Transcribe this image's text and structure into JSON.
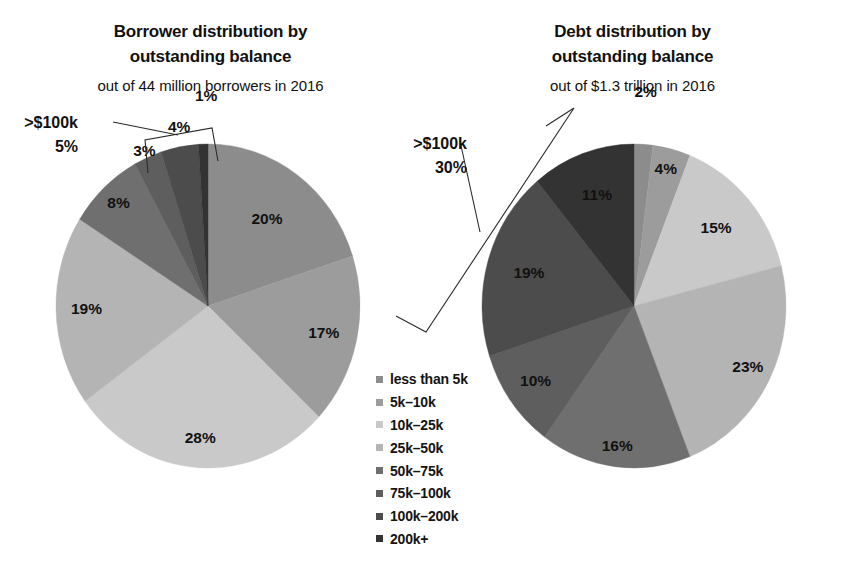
{
  "figure": {
    "background": "#ffffff",
    "text_color": "#111111"
  },
  "left": {
    "title_line1": "Borrower distribution by",
    "title_line2": "outstanding balance",
    "subtitle": "out of  44 million borrowers in 2016",
    "callout_line1": ">$100k",
    "callout_line2": "5%"
  },
  "right": {
    "title_line1": "Debt distribution by",
    "title_line2": "outstanding balance",
    "subtitle": "out of $1.3 trillion in 2016",
    "callout_line1": ">$100k",
    "callout_line2": "30%"
  },
  "legend": {
    "position": "center-bottom",
    "items": [
      {
        "label": "less than 5k",
        "color": "#8c8c8c"
      },
      {
        "label": "5k–10k",
        "color": "#9c9c9c"
      },
      {
        "label": "10k–25k",
        "color": "#c9c9c9"
      },
      {
        "label": "25k–50k",
        "color": "#b4b4b4"
      },
      {
        "label": "50k–75k",
        "color": "#6f6f6f"
      },
      {
        "label": "75k–100k",
        "color": "#5e5e5e"
      },
      {
        "label": "100k–200k",
        "color": "#4c4c4c"
      },
      {
        "label": "200k+",
        "color": "#333333"
      }
    ]
  },
  "chart_data": [
    {
      "type": "pie",
      "title": "Borrower distribution by outstanding balance",
      "subtitle": "out of  44 million borrowers in 2016",
      "categories": [
        "less than 5k",
        "5k–10k",
        "10k–25k",
        "25k–50k",
        "50k–75k",
        "75k–100k",
        "100k–200k",
        "200k+"
      ],
      "values": [
        20,
        17,
        28,
        19,
        8,
        3,
        4,
        1
      ],
      "labels": [
        "20%",
        "17%",
        "28%",
        "19%",
        "8%",
        "3%",
        "4%",
        "1%"
      ],
      "colors": [
        "#8c8c8c",
        "#9c9c9c",
        "#c9c9c9",
        "#b4b4b4",
        "#6f6f6f",
        "#5e5e5e",
        "#4c4c4c",
        "#333333"
      ],
      "unit": "percent",
      "start_angle_deg": 0,
      "direction": "clockwise",
      "annotation": {
        "text": ">$100k 5%",
        "covers": [
          "100k–200k",
          "200k+"
        ],
        "sum": 5
      }
    },
    {
      "type": "pie",
      "title": "Debt distribution by outstanding balance",
      "subtitle": "out of $1.3 trillion in 2016",
      "categories": [
        "less than 5k",
        "5k–10k",
        "10k–25k",
        "25k–50k",
        "50k–75k",
        "75k–100k",
        "100k–200k",
        "200k+"
      ],
      "values": [
        2,
        4,
        15,
        23,
        16,
        10,
        19,
        11
      ],
      "labels": [
        "2%",
        "4%",
        "15%",
        "23%",
        "16%",
        "10%",
        "19%",
        "11%"
      ],
      "colors": [
        "#8c8c8c",
        "#9c9c9c",
        "#c9c9c9",
        "#b4b4b4",
        "#6f6f6f",
        "#5e5e5e",
        "#4c4c4c",
        "#333333"
      ],
      "unit": "percent",
      "start_angle_deg": 0,
      "direction": "clockwise",
      "annotation": {
        "text": ">$100k 30%",
        "covers": [
          "100k–200k",
          "200k+"
        ],
        "sum": 30
      }
    }
  ]
}
